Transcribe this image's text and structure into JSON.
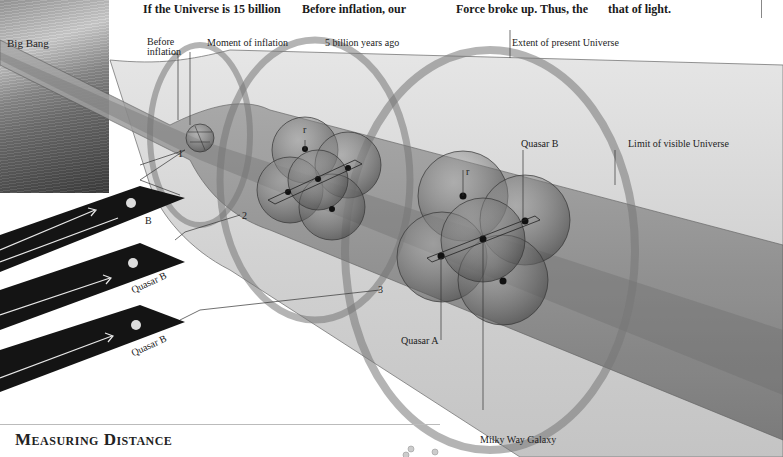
{
  "headlines": [
    "If the Universe is 15 billion",
    "Before inflation, our",
    "Force broke up. Thus, the",
    "that of light."
  ],
  "labels": {
    "big_bang": "Big Bang",
    "before_inflation": "Before\ninflation",
    "before_inflation_line1": "Before",
    "before_inflation_line2": "inflation",
    "moment_of_inflation": "Moment of inflation",
    "five_billion": "5 billion years ago",
    "extent_present": "Extent of present Universe",
    "limit_visible": "Limit of visible Universe",
    "quasar_b_top": "Quasar B",
    "quasar_a": "Quasar A",
    "milky_way": "Milky Way Galaxy",
    "radius_r": "r",
    "stage_1": "1",
    "stage_2": "2",
    "stage_3": "3",
    "strip_1": "B",
    "strip_2": "Quasar B",
    "strip_3": "Quasar B"
  },
  "section_title": "Measuring Distance",
  "colors": {
    "tube_light": "#d8d8d8",
    "tube_dark": "#8a8a8a",
    "sphere": "#6a6a6a",
    "strip": "#141414"
  }
}
